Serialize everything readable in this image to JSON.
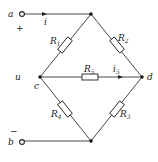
{
  "diagram": {
    "type": "bridge-circuit",
    "terminals": {
      "a": {
        "label": "a",
        "polarity": "+"
      },
      "b": {
        "label": "b",
        "polarity": "−"
      }
    },
    "nodes": {
      "c": {
        "label": "c"
      },
      "d": {
        "label": "d"
      },
      "u": {
        "label": "u"
      }
    },
    "currents": {
      "i": {
        "label": "i"
      },
      "i5": {
        "label": "i",
        "sub": "5"
      }
    },
    "resistors": [
      {
        "id": "R1",
        "label": "R",
        "sub": "1",
        "between": "top-c"
      },
      {
        "id": "R2",
        "label": "R",
        "sub": "2",
        "between": "top-d"
      },
      {
        "id": "R3",
        "label": "R",
        "sub": "3",
        "between": "d-bottom"
      },
      {
        "id": "R4",
        "label": "R",
        "sub": "4",
        "between": "c-bottom"
      },
      {
        "id": "R5",
        "label": "R",
        "sub": "5",
        "between": "c-d"
      }
    ]
  }
}
